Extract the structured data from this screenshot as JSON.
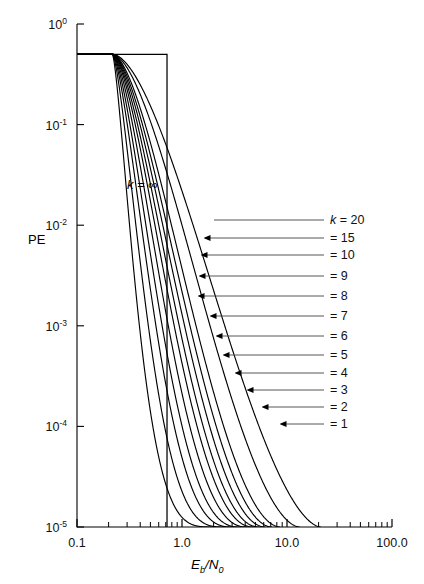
{
  "chart_data": {
    "type": "line",
    "title": "",
    "xlabel": "Eb/N0",
    "ylabel": "PE",
    "xscale": "log",
    "yscale": "log",
    "xlim": [
      0.1,
      100.0
    ],
    "ylim": [
      1e-05,
      1.0
    ],
    "grid": false,
    "legend_position": "right-inline-leader-lines",
    "x_tick_labels": [
      "0.1",
      "1.0",
      "10.0",
      "100.0"
    ],
    "x_tick_values": [
      0.1,
      1.0,
      10.0,
      100.0
    ],
    "y_tick_labels": [
      "10-5",
      "10-4",
      "10-3",
      "10-2",
      "10-1",
      "100"
    ],
    "y_tick_mantissa": "10",
    "y_tick_exponents": [
      "0",
      "-1",
      "-2",
      "-3",
      "-4",
      "-5"
    ],
    "y_tick_values": [
      1.0,
      0.1,
      0.01,
      0.001,
      0.0001,
      1e-05
    ],
    "annotations": [
      {
        "text_italic": "k",
        "text": " = ",
        "value": "∞",
        "x": 0.36,
        "y": 0.017
      }
    ],
    "series": [
      {
        "name": "k = 20",
        "label_prefix": "k",
        "label_text": " = 20",
        "x0": 0.1,
        "y0": 0.5,
        "knee": 0.72,
        "steep": 2.1,
        "xend": 21.0,
        "label_y_px": 224,
        "leader_x_px": 214,
        "arrow": false
      },
      {
        "name": "= 15",
        "label_prefix": "",
        "label_text": "= 15",
        "x0": 0.1,
        "y0": 0.5,
        "knee": 0.72,
        "steep": 2.32,
        "xend": 13.2,
        "label_y_px": 242,
        "leader_x_px": 210,
        "arrow": true
      },
      {
        "name": "= 10",
        "label_prefix": "",
        "label_text": "= 10",
        "x0": 0.1,
        "y0": 0.5,
        "knee": 0.72,
        "steep": 2.62,
        "xend": 8.6,
        "label_y_px": 259,
        "leader_x_px": 207,
        "arrow": true
      },
      {
        "name": "= 9",
        "label_prefix": "",
        "label_text": "= 9",
        "x0": 0.1,
        "y0": 0.5,
        "knee": 0.72,
        "steep": 2.8,
        "xend": 7.2,
        "label_y_px": 280,
        "leader_x_px": 205,
        "arrow": true
      },
      {
        "name": "= 8",
        "label_prefix": "",
        "label_text": "= 8",
        "x0": 0.1,
        "y0": 0.5,
        "knee": 0.72,
        "steep": 3.0,
        "xend": 6.2,
        "label_y_px": 300,
        "leader_x_px": 204,
        "arrow": true
      },
      {
        "name": "= 7",
        "label_prefix": "",
        "label_text": "= 7",
        "x0": 0.1,
        "y0": 0.5,
        "knee": 0.72,
        "steep": 3.25,
        "xend": 5.4,
        "label_y_px": 320,
        "leader_x_px": 216,
        "arrow": true
      },
      {
        "name": "= 6",
        "label_prefix": "",
        "label_text": "= 6",
        "x0": 0.1,
        "y0": 0.5,
        "knee": 0.72,
        "steep": 3.55,
        "xend": 4.8,
        "label_y_px": 340,
        "leader_x_px": 222,
        "arrow": true
      },
      {
        "name": "= 5",
        "label_prefix": "",
        "label_text": "= 5",
        "x0": 0.1,
        "y0": 0.5,
        "knee": 0.72,
        "steep": 3.95,
        "xend": 4.15,
        "label_y_px": 359,
        "leader_x_px": 229,
        "arrow": true
      },
      {
        "name": "= 4",
        "label_prefix": "",
        "label_text": "= 4",
        "x0": 0.1,
        "y0": 0.5,
        "knee": 0.72,
        "steep": 4.45,
        "xend": 3.55,
        "label_y_px": 377,
        "leader_x_px": 241,
        "arrow": true
      },
      {
        "name": "= 3",
        "label_prefix": "",
        "label_text": "= 3",
        "x0": 0.1,
        "y0": 0.5,
        "knee": 0.72,
        "steep": 5.1,
        "xend": 3.05,
        "label_y_px": 394,
        "leader_x_px": 253,
        "arrow": true
      },
      {
        "name": "= 2",
        "label_prefix": "",
        "label_text": "= 2",
        "x0": 0.1,
        "y0": 0.5,
        "knee": 0.72,
        "steep": 6.2,
        "xend": 2.55,
        "label_y_px": 411,
        "leader_x_px": 268,
        "arrow": true
      },
      {
        "name": "= 1",
        "label_prefix": "",
        "label_text": "= 1",
        "x0": 0.1,
        "y0": 0.5,
        "knee": 0.72,
        "steep": 8.3,
        "xend": 2.1,
        "label_y_px": 428,
        "leader_x_px": 286,
        "arrow": true
      }
    ],
    "step_curve": {
      "name": "k = infinity",
      "y_level": 0.5,
      "x_drop": 0.72
    }
  },
  "figure": {
    "y_axis_label": "PE",
    "x_axis_label_parts": {
      "e": "E",
      "b": "b",
      "slash": "/",
      "n": "N",
      "zero": "0"
    },
    "k_infinity_label": {
      "k": "k",
      "eq": "=",
      "inf": "∞"
    },
    "colors": {
      "ink": "#000000",
      "leader": "#555555",
      "background": "#ffffff"
    }
  }
}
